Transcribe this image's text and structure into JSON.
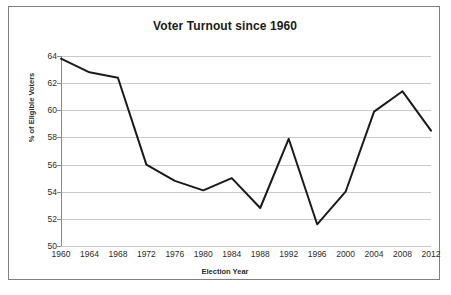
{
  "chart_data": {
    "type": "line",
    "title": "Voter Turnout since 1960",
    "xlabel": "Election Year",
    "ylabel": "% of Eligible Voters",
    "categories": [
      "1960",
      "1964",
      "1968",
      "1972",
      "1976",
      "1980",
      "1984",
      "1988",
      "1992",
      "1996",
      "2000",
      "2004",
      "2008",
      "2012"
    ],
    "values": [
      63.8,
      62.8,
      62.4,
      56.0,
      54.8,
      54.1,
      55.0,
      52.8,
      57.9,
      51.6,
      54.0,
      59.9,
      61.4,
      58.5
    ],
    "series": [
      {
        "name": "Voter Turnout",
        "values": [
          63.8,
          62.8,
          62.4,
          56.0,
          54.8,
          54.1,
          55.0,
          52.8,
          57.9,
          51.6,
          54.0,
          59.9,
          61.4,
          58.5
        ]
      }
    ],
    "ylim": [
      50,
      64
    ],
    "ytick_values": [
      50,
      52,
      54,
      56,
      58,
      60,
      62,
      64
    ],
    "ytick_labels": [
      "50",
      "52",
      "54",
      "56",
      "58",
      "60",
      "62",
      "64"
    ],
    "xlim": [
      "1960",
      "2012"
    ],
    "grid": "horizontal",
    "legend": "none",
    "line_color": "#1a1a1a",
    "grid_color": "#c9c9c9",
    "axis_color": "#8a8a8a",
    "background_color": "#ffffff",
    "border_color": "#808080"
  }
}
